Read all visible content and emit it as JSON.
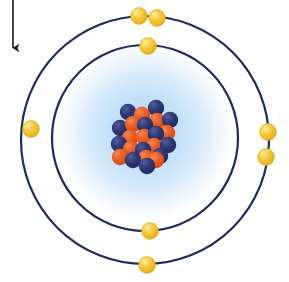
{
  "figure": {
    "title": "Bohr model of the atom",
    "caption": "",
    "background_color": "#ffffff"
  },
  "annotation": {
    "arrow": {
      "icon": "arrow-down-icon",
      "label": "",
      "color": "#1a1a1a",
      "x": 13,
      "y_start": 0,
      "y_end": 48,
      "head_width": 9,
      "head_length": 8,
      "stroke_width": 1.6
    }
  },
  "nucleus": {
    "label": "nucleus",
    "center_x": 145,
    "center_y": 132,
    "glow": {
      "label": "electron-cloud-glow",
      "radius": 92,
      "color_inner": "#bcddf5",
      "color_mid": "#cfe7f8",
      "color_outer": "#ffffff"
    },
    "particle_radius": 8.2,
    "proton": {
      "label": "proton",
      "color": "#e8511f",
      "highlight": "#f58a56",
      "count": 11
    },
    "neutron": {
      "label": "neutron",
      "color": "#2b3570",
      "highlight": "#525f9c",
      "count": 12
    },
    "particles": [
      {
        "type": "neutron",
        "x": 128,
        "y": 112
      },
      {
        "type": "neutron",
        "x": 156,
        "y": 108
      },
      {
        "type": "proton",
        "x": 142,
        "y": 115
      },
      {
        "type": "proton",
        "x": 157,
        "y": 121
      },
      {
        "type": "neutron",
        "x": 170,
        "y": 120
      },
      {
        "type": "neutron",
        "x": 120,
        "y": 128
      },
      {
        "type": "proton",
        "x": 133,
        "y": 124
      },
      {
        "type": "neutron",
        "x": 145,
        "y": 125
      },
      {
        "type": "proton",
        "x": 167,
        "y": 133
      },
      {
        "type": "proton",
        "x": 130,
        "y": 138
      },
      {
        "type": "proton",
        "x": 144,
        "y": 137
      },
      {
        "type": "neutron",
        "x": 156,
        "y": 134
      },
      {
        "type": "neutron",
        "x": 119,
        "y": 144
      },
      {
        "type": "proton",
        "x": 154,
        "y": 146
      },
      {
        "type": "neutron",
        "x": 168,
        "y": 145
      },
      {
        "type": "proton",
        "x": 131,
        "y": 149
      },
      {
        "type": "neutron",
        "x": 143,
        "y": 150
      },
      {
        "type": "proton",
        "x": 120,
        "y": 157
      },
      {
        "type": "proton",
        "x": 146,
        "y": 158
      },
      {
        "type": "neutron",
        "x": 133,
        "y": 160
      },
      {
        "type": "neutron",
        "x": 160,
        "y": 156
      },
      {
        "type": "proton",
        "x": 156,
        "y": 160
      },
      {
        "type": "neutron",
        "x": 147,
        "y": 166
      }
    ]
  },
  "orbits": [
    {
      "name": "inner-orbit",
      "label": "First electron shell",
      "center_x": 145,
      "center_y": 138,
      "radius": 93,
      "stroke_color": "#1f2a5e",
      "stroke_width": 2.2,
      "electron_count": 2
    },
    {
      "name": "outer-orbit",
      "label": "Second electron shell",
      "center_x": 145,
      "center_y": 140,
      "radius": 124,
      "stroke_color": "#1f2a5e",
      "stroke_width": 2.2,
      "electron_count": 6
    }
  ],
  "electron": {
    "label": "electron",
    "color": "#f3c32e",
    "highlight": "#fbe78d",
    "edge": "#e0a81c",
    "radius": 8.4,
    "total_count": 8
  },
  "electrons": [
    {
      "orbit": "outer-orbit",
      "position": "top-left",
      "x": 139,
      "y": 16
    },
    {
      "orbit": "outer-orbit",
      "position": "top-right",
      "x": 157,
      "y": 18
    },
    {
      "orbit": "inner-orbit",
      "position": "top",
      "x": 148,
      "y": 46
    },
    {
      "orbit": "outer-orbit",
      "position": "left",
      "x": 31,
      "y": 129
    },
    {
      "orbit": "outer-orbit",
      "position": "right-upper",
      "x": 268,
      "y": 132
    },
    {
      "orbit": "outer-orbit",
      "position": "right-lower",
      "x": 266,
      "y": 157
    },
    {
      "orbit": "inner-orbit",
      "position": "bottom",
      "x": 150,
      "y": 231
    },
    {
      "orbit": "outer-orbit",
      "position": "bottom",
      "x": 147,
      "y": 265
    }
  ]
}
